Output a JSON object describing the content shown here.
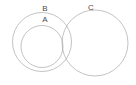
{
  "diagram": {
    "type": "euler-venn",
    "canvas": {
      "width": 136,
      "height": 85,
      "background": "#ffffff"
    },
    "stroke_color": "#a9a9a9",
    "label_color": "#4d4d4d",
    "sets": [
      {
        "id": "a",
        "label": "A",
        "cx": 42,
        "cy": 46.5,
        "r": 21,
        "label_x": 45,
        "label_y": 22,
        "relation": "inside B"
      },
      {
        "id": "b",
        "label": "B",
        "cx": 42,
        "cy": 42,
        "r": 29.5,
        "label_x": 45,
        "label_y": 11,
        "relation": "contains A; overlaps C"
      },
      {
        "id": "c",
        "label": "C",
        "cx": 95,
        "cy": 43,
        "r": 33,
        "label_x": 91,
        "label_y": 10,
        "relation": "overlaps B"
      }
    ]
  }
}
